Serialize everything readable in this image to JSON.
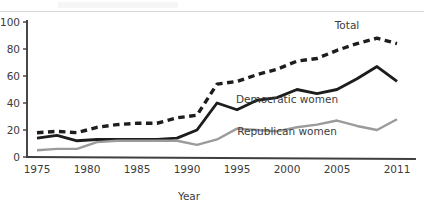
{
  "chart_data": {
    "type": "line",
    "title": "",
    "xlabel": "Year",
    "ylabel": "",
    "xlim": [
      1975,
      2011
    ],
    "ylim": [
      0,
      100
    ],
    "grid": false,
    "legend_position": "inline-labels",
    "x_tick_labels": [
      "1975",
      "1980",
      "1985",
      "1990",
      "1995",
      "2000",
      "2005",
      "2011"
    ],
    "x_tick_values": [
      1975,
      1980,
      1985,
      1990,
      1995,
      2000,
      2005,
      2011
    ],
    "y_tick_labels": [
      "0",
      "20",
      "40",
      "60",
      "80",
      "100"
    ],
    "y_tick_values": [
      0,
      20,
      40,
      60,
      80,
      100
    ],
    "x": [
      1975,
      1977,
      1979,
      1981,
      1983,
      1985,
      1987,
      1989,
      1991,
      1993,
      1995,
      1997,
      1999,
      2001,
      2003,
      2005,
      2007,
      2009,
      2011
    ],
    "series": [
      {
        "name": "Total",
        "style": "dashed",
        "color": "#1d1d1d",
        "values": [
          18,
          19,
          18,
          22,
          24,
          25,
          25,
          29,
          31,
          54,
          56,
          61,
          65,
          71,
          73,
          79,
          84,
          88,
          84
        ]
      },
      {
        "name": "Democratic women",
        "style": "solid",
        "color": "#1d1d1d",
        "values": [
          14,
          16,
          12,
          13,
          13,
          13,
          13,
          14,
          20,
          40,
          35,
          42,
          44,
          50,
          47,
          50,
          58,
          67,
          56
        ]
      },
      {
        "name": "Republican women",
        "style": "solid",
        "color": "#9b9b9b",
        "values": [
          5,
          6,
          6,
          11,
          12,
          12,
          12,
          12,
          9,
          13,
          21,
          20,
          19,
          22,
          24,
          27,
          23,
          20,
          28
        ]
      }
    ],
    "annotations": [
      {
        "text": "Total",
        "x": 2006,
        "y": 95
      },
      {
        "text": "Democratic women",
        "x": 2000,
        "y": 40
      },
      {
        "text": "Republican women",
        "x": 2000,
        "y": 16
      }
    ]
  },
  "axis": {
    "x_title": "Year"
  }
}
